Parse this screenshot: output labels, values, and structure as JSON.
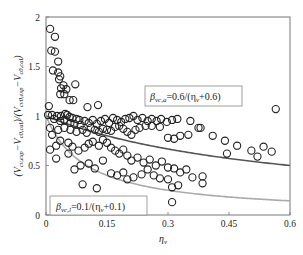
{
  "chart_data": {
    "type": "scatter",
    "title": "",
    "xlabel": "η_v",
    "ylabel": "(V_cv,exp − V_c0,cal)/(V_cv0,exp − V_c0,cal)",
    "xlim": [
      0,
      0.6
    ],
    "ylim": [
      0,
      2
    ],
    "xticks": [
      0,
      0.15,
      0.3,
      0.45,
      0.6
    ],
    "xtick_labels": [
      "0",
      "0.15",
      "0.3",
      "0.45",
      "0.6"
    ],
    "yticks": [
      0,
      0.5,
      1,
      1.5,
      2
    ],
    "ytick_labels": [
      "0",
      "0.5",
      "1",
      "1.5",
      "2"
    ],
    "grid": false,
    "series": [
      {
        "name": "Experimental data",
        "kind": "scatter",
        "marker": "open-circle",
        "color": "#222222",
        "points": [
          [
            0.01,
            1.88
          ],
          [
            0.022,
            1.8
          ],
          [
            0.013,
            1.66
          ],
          [
            0.022,
            1.65
          ],
          [
            0.03,
            1.55
          ],
          [
            0.017,
            1.46
          ],
          [
            0.03,
            1.44
          ],
          [
            0.035,
            1.4
          ],
          [
            0.032,
            1.37
          ],
          [
            0.043,
            1.31
          ],
          [
            0.037,
            1.28
          ],
          [
            0.05,
            1.27
          ],
          [
            0.045,
            1.22
          ],
          [
            0.035,
            1.22
          ],
          [
            0.072,
            1.32
          ],
          [
            0.058,
            1.16
          ],
          [
            0.067,
            1.16
          ],
          [
            0.102,
            1.09
          ],
          [
            0.128,
            1.11
          ],
          [
            0.007,
            1.1
          ],
          [
            0.005,
            1.01
          ],
          [
            0.015,
            1.01
          ],
          [
            0.027,
            1.0
          ],
          [
            0.037,
            1.0
          ],
          [
            0.047,
            1.02
          ],
          [
            0.052,
            1.01
          ],
          [
            0.058,
            0.99
          ],
          [
            0.065,
            0.98
          ],
          [
            0.075,
            0.97
          ],
          [
            0.082,
            0.96
          ],
          [
            0.02,
            0.97
          ],
          [
            0.035,
            0.95
          ],
          [
            0.045,
            0.96
          ],
          [
            0.06,
            0.93
          ],
          [
            0.07,
            0.92
          ],
          [
            0.085,
            0.91
          ],
          [
            0.095,
            0.95
          ],
          [
            0.105,
            0.93
          ],
          [
            0.115,
            0.96
          ],
          [
            0.125,
            0.92
          ],
          [
            0.135,
            0.95
          ],
          [
            0.145,
            0.97
          ],
          [
            0.155,
            0.93
          ],
          [
            0.165,
            0.98
          ],
          [
            0.175,
            0.96
          ],
          [
            0.185,
            0.94
          ],
          [
            0.195,
            0.97
          ],
          [
            0.205,
            0.98
          ],
          [
            0.215,
            1.0
          ],
          [
            0.225,
            0.96
          ],
          [
            0.237,
            0.98
          ],
          [
            0.25,
            0.95
          ],
          [
            0.26,
            0.97
          ],
          [
            0.272,
            0.95
          ],
          [
            0.283,
            0.97
          ],
          [
            0.297,
            0.94
          ],
          [
            0.31,
            0.96
          ],
          [
            0.323,
            0.97
          ],
          [
            0.355,
            0.95
          ],
          [
            0.375,
            0.88
          ],
          [
            0.38,
            0.88
          ],
          [
            0.41,
            0.8
          ],
          [
            0.44,
            0.75
          ],
          [
            0.445,
            0.62
          ],
          [
            0.47,
            0.7
          ],
          [
            0.505,
            0.65
          ],
          [
            0.52,
            0.59
          ],
          [
            0.535,
            0.69
          ],
          [
            0.555,
            0.64
          ],
          [
            0.565,
            1.07
          ],
          [
            0.01,
            0.88
          ],
          [
            0.015,
            0.81
          ],
          [
            0.03,
            0.86
          ],
          [
            0.045,
            0.88
          ],
          [
            0.06,
            0.86
          ],
          [
            0.075,
            0.84
          ],
          [
            0.09,
            0.86
          ],
          [
            0.1,
            0.83
          ],
          [
            0.11,
            0.88
          ],
          [
            0.12,
            0.86
          ],
          [
            0.13,
            0.84
          ],
          [
            0.14,
            0.87
          ],
          [
            0.15,
            0.86
          ],
          [
            0.16,
            0.85
          ],
          [
            0.17,
            0.89
          ],
          [
            0.18,
            0.9
          ],
          [
            0.19,
            0.87
          ],
          [
            0.2,
            0.84
          ],
          [
            0.21,
            0.81
          ],
          [
            0.22,
            0.86
          ],
          [
            0.23,
            0.88
          ],
          [
            0.245,
            0.9
          ],
          [
            0.26,
            0.9
          ],
          [
            0.28,
            0.89
          ],
          [
            0.3,
            0.78
          ],
          [
            0.315,
            0.77
          ],
          [
            0.33,
            0.8
          ],
          [
            0.35,
            0.81
          ],
          [
            0.01,
            0.66
          ],
          [
            0.025,
            0.7
          ],
          [
            0.035,
            0.75
          ],
          [
            0.055,
            0.73
          ],
          [
            0.065,
            0.69
          ],
          [
            0.08,
            0.65
          ],
          [
            0.095,
            0.68
          ],
          [
            0.105,
            0.72
          ],
          [
            0.115,
            0.74
          ],
          [
            0.13,
            0.7
          ],
          [
            0.14,
            0.76
          ],
          [
            0.15,
            0.73
          ],
          [
            0.16,
            0.68
          ],
          [
            0.17,
            0.65
          ],
          [
            0.18,
            0.62
          ],
          [
            0.19,
            0.66
          ],
          [
            0.2,
            0.6
          ],
          [
            0.21,
            0.55
          ],
          [
            0.225,
            0.58
          ],
          [
            0.24,
            0.53
          ],
          [
            0.255,
            0.56
          ],
          [
            0.27,
            0.5
          ],
          [
            0.285,
            0.54
          ],
          [
            0.3,
            0.48
          ],
          [
            0.315,
            0.47
          ],
          [
            0.33,
            0.43
          ],
          [
            0.345,
            0.46
          ],
          [
            0.36,
            0.38
          ],
          [
            0.385,
            0.39
          ],
          [
            0.3,
            0.36
          ],
          [
            0.31,
            0.28
          ],
          [
            0.325,
            0.3
          ],
          [
            0.31,
            0.13
          ],
          [
            0.055,
            0.62
          ],
          [
            0.025,
            0.57
          ],
          [
            0.07,
            0.46
          ],
          [
            0.085,
            0.5
          ],
          [
            0.105,
            0.52
          ],
          [
            0.12,
            0.47
          ],
          [
            0.14,
            0.55
          ],
          [
            0.16,
            0.42
          ],
          [
            0.175,
            0.4
          ],
          [
            0.19,
            0.43
          ],
          [
            0.2,
            0.36
          ],
          [
            0.215,
            0.38
          ],
          [
            0.235,
            0.41
          ],
          [
            0.25,
            0.46
          ],
          [
            0.265,
            0.4
          ],
          [
            0.28,
            0.37
          ],
          [
            0.09,
            0.31
          ],
          [
            0.125,
            0.27
          ],
          [
            0.385,
            0.32
          ]
        ]
      },
      {
        "name": "β_vc,a = 0.6/(η_v+0.6)",
        "kind": "line",
        "color": "#555555",
        "formula": "0.6/(x+0.6)",
        "x": [
          0,
          0.05,
          0.1,
          0.15,
          0.2,
          0.25,
          0.3,
          0.35,
          0.4,
          0.45,
          0.5,
          0.55,
          0.6
        ],
        "y": [
          1.0,
          0.923,
          0.857,
          0.8,
          0.75,
          0.706,
          0.667,
          0.632,
          0.6,
          0.571,
          0.545,
          0.522,
          0.5
        ]
      },
      {
        "name": "β_vc,l = 0.1/(η_v+0.1)",
        "kind": "line",
        "color": "#aaaaaa",
        "formula": "0.1/(x+0.1)",
        "x": [
          0,
          0.025,
          0.05,
          0.075,
          0.1,
          0.15,
          0.2,
          0.25,
          0.3,
          0.35,
          0.4,
          0.45,
          0.5,
          0.55,
          0.6
        ],
        "y": [
          1.0,
          0.8,
          0.667,
          0.571,
          0.5,
          0.4,
          0.333,
          0.286,
          0.25,
          0.222,
          0.2,
          0.182,
          0.167,
          0.154,
          0.143
        ]
      }
    ],
    "annotations": [
      {
        "id": "legend_a",
        "text_main": "β",
        "text_sub": "vc,a",
        "text_rest": "=0.6/(η",
        "text_sub2": "v",
        "text_end": "+0.6)"
      },
      {
        "id": "legend_l",
        "text_main": "β",
        "text_sub": "vc,l",
        "text_rest": "=0.1/(η",
        "text_sub2": "v",
        "text_end": "+0.1)"
      }
    ]
  },
  "axes": {
    "x_title_main": "η",
    "x_title_sub": "v",
    "y_title": {
      "p1": "(V",
      "s1": "cv,exp",
      "p2": "−V",
      "s2": "c0,cal",
      "p3": ")/(V",
      "s3": "cv0,exp",
      "p4": "−V",
      "s4": "c0,cal",
      "p5": ")"
    }
  }
}
